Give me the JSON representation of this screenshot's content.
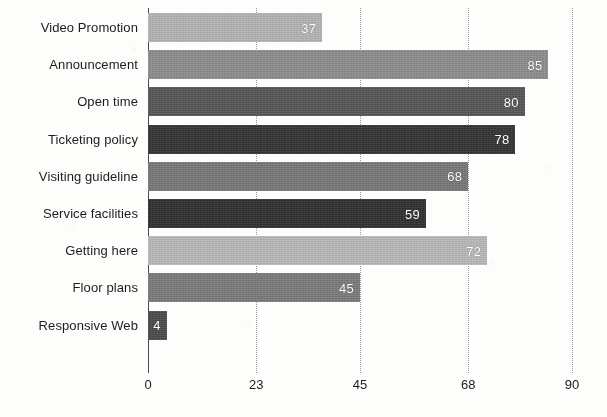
{
  "chart_data": {
    "type": "bar",
    "orientation": "horizontal",
    "title": "",
    "subtitle": "",
    "xlabel": "",
    "ylabel": "",
    "xlim": [
      0,
      90
    ],
    "ylim": null,
    "grid": true,
    "grid_axis": "x",
    "grid_style": "dotted",
    "legend": false,
    "legend_position": "none",
    "xticks": [
      0,
      23,
      45,
      68,
      90
    ],
    "xtick_labels": [
      "0",
      "23",
      "45",
      "68",
      "90"
    ],
    "categories": [
      "Video Promotion",
      "Announcement",
      "Open time",
      "Ticketing policy",
      "Visiting guideline",
      "Service facilities",
      "Getting here",
      "Floor plans",
      "Responsive Web"
    ],
    "values": [
      37,
      85,
      80,
      78,
      68,
      59,
      72,
      45,
      4
    ],
    "data_labels": [
      "37",
      "85",
      "80",
      "78",
      "68",
      "59",
      "72",
      "45",
      "4"
    ],
    "bar_colors": [
      "#b3b3b3",
      "#8c8c8c",
      "#555555",
      "#333333",
      "#777777",
      "#2f2f2f",
      "#b8b8b8",
      "#7a7a7a",
      "#4a4a4a"
    ],
    "bars": [
      {
        "category": "Video Promotion",
        "value": 37,
        "label": "37",
        "color": "#b3b3b3",
        "label_inside": true
      },
      {
        "category": "Announcement",
        "value": 85,
        "label": "85",
        "color": "#8c8c8c",
        "label_inside": true
      },
      {
        "category": "Open time",
        "value": 80,
        "label": "80",
        "color": "#555555",
        "label_inside": true
      },
      {
        "category": "Ticketing policy",
        "value": 78,
        "label": "78",
        "color": "#333333",
        "label_inside": true
      },
      {
        "category": "Visiting guideline",
        "value": 68,
        "label": "68",
        "color": "#777777",
        "label_inside": true
      },
      {
        "category": "Service facilities",
        "value": 59,
        "label": "59",
        "color": "#2f2f2f",
        "label_inside": true
      },
      {
        "category": "Getting here",
        "value": 72,
        "label": "72",
        "color": "#b8b8b8",
        "label_inside": true
      },
      {
        "category": "Floor plans",
        "value": 45,
        "label": "45",
        "color": "#7a7a7a",
        "label_inside": true
      },
      {
        "category": "Responsive Web",
        "value": 4,
        "label": "4",
        "color": "#4a4a4a",
        "label_inside": true
      }
    ],
    "axis_color": "#4a4a4a",
    "gridline_color": "#9a9a9a",
    "background_color": "#fdfdfc",
    "text_color": "#1c1c1c",
    "data_label_color": "#ffffff"
  }
}
